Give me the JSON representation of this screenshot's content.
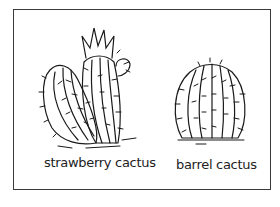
{
  "figure": {
    "labels": {
      "strawberry": "strawberry cactus",
      "barrel": "barrel cactus"
    },
    "colors": {
      "ink": "#1a1a1a",
      "background": "#ffffff",
      "border": "#3a3a3a"
    }
  }
}
